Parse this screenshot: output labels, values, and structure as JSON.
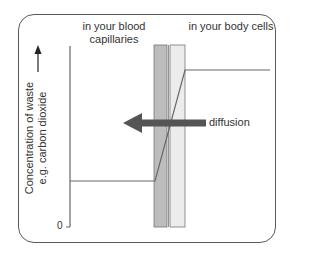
{
  "diagram": {
    "regions": [
      {
        "label": "in your blood capillaries"
      },
      {
        "label": "in your body cells"
      }
    ],
    "y_axis": {
      "label": "Concentration of waste e.g. carbon dioxide",
      "label_line1": "Concentration of waste",
      "label_line2": "e.g. carbon dioxide",
      "origin_label": "0"
    },
    "arrow": {
      "label": "diffusion",
      "direction": "left",
      "color": "#555555"
    },
    "levels": {
      "capillaries": "low",
      "body_cells": "high"
    },
    "colors": {
      "membrane_dark": "#bdbdbd",
      "membrane_light": "#ececec",
      "line": "#666666",
      "frame": "#5a5a5a"
    }
  }
}
